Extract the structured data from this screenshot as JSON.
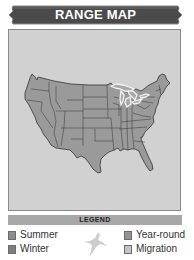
{
  "header": {
    "title": "RANGE MAP"
  },
  "map": {
    "region": "Contiguous United States",
    "highlighted_feature": "Great Lakes outline",
    "colors": {
      "background": "#d1d1d1",
      "land": "#9a9a9a",
      "borders": "#3a3a3a",
      "lakes_outline": "#f2f2f2"
    }
  },
  "legend": {
    "title": "LEGEND",
    "items": [
      {
        "label": "Summer",
        "color": "#8c8c8c"
      },
      {
        "label": "Winter",
        "color": "#7d7d7d"
      },
      {
        "label": "Year-round",
        "color": "#949494"
      },
      {
        "label": "Migration",
        "color": "#c4c4c4"
      }
    ],
    "icon": "bird-silhouette-icon"
  }
}
